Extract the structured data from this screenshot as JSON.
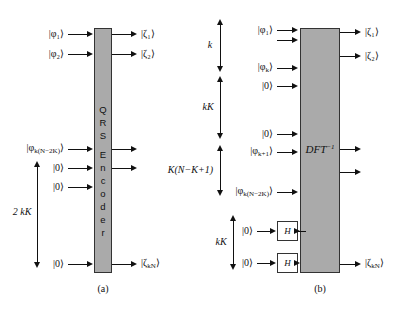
{
  "figure": {
    "panels": [
      {
        "id": "a",
        "caption": "(a)",
        "block": {
          "label": "QRS Encoder",
          "letters": [
            "Q",
            "R",
            "S",
            "E",
            "n",
            "c",
            "o",
            "d",
            "e",
            "r"
          ]
        },
        "inputs": [
          {
            "name": "input-phi-1",
            "label": "|φ₁⟩"
          },
          {
            "name": "input-phi-2",
            "label": "|φ₂⟩"
          },
          {
            "name": "input-phi-kn2k",
            "label": "|φ",
            "sub": "k(N−2K)",
            "tail": "⟩"
          },
          {
            "name": "input-zero-1",
            "label": "|0⟩"
          },
          {
            "name": "input-zero-2",
            "label": "|0⟩"
          },
          {
            "name": "input-zero-3",
            "label": "|0⟩"
          }
        ],
        "outputs": [
          {
            "name": "output-zeta-1",
            "label": "|ζ₁⟩"
          },
          {
            "name": "output-zeta-2",
            "label": "|ζ₂⟩"
          },
          {
            "name": "output-unlabeled-1",
            "label": ""
          },
          {
            "name": "output-unlabeled-2",
            "label": ""
          },
          {
            "name": "output-zeta-kn",
            "label": "|ζ",
            "sub": "kN",
            "tail": "⟩"
          }
        ],
        "braces": [
          {
            "name": "brace-2kK",
            "label": "2 kK"
          }
        ]
      },
      {
        "id": "b",
        "caption": "(b)",
        "block": {
          "label": "DFT",
          "sup": "−1"
        },
        "gates": [
          {
            "name": "hadamard-gate-1",
            "label": "H"
          },
          {
            "name": "hadamard-gate-2",
            "label": "H"
          }
        ],
        "inputs": [
          {
            "name": "input-phi-1",
            "label": "|φ₁⟩"
          },
          {
            "name": "input-phi-1-second",
            "label": ""
          },
          {
            "name": "input-phi-k",
            "label": "|φ",
            "sub": "k",
            "tail": "⟩"
          },
          {
            "name": "input-zero-1",
            "label": "|0⟩"
          },
          {
            "name": "input-zero-2",
            "label": "|0⟩"
          },
          {
            "name": "input-phi-k1",
            "label": "|φ",
            "sub": "k+1",
            "tail": "⟩"
          },
          {
            "name": "input-phi-kn2k",
            "label": "|φ",
            "sub": "k(N−2K)",
            "tail": "⟩"
          },
          {
            "name": "input-zero-h1",
            "label": "|0⟩"
          },
          {
            "name": "input-zero-h2",
            "label": "|0⟩"
          }
        ],
        "outputs": [
          {
            "name": "output-zeta-1",
            "label": "|ζ₁⟩"
          },
          {
            "name": "output-zeta-2",
            "label": "|ζ₂⟩"
          },
          {
            "name": "output-unlabeled-1",
            "label": ""
          },
          {
            "name": "output-unlabeled-2",
            "label": ""
          },
          {
            "name": "output-zeta-kn",
            "label": "|ζ",
            "sub": "kN",
            "tail": "⟩"
          }
        ],
        "braces": [
          {
            "name": "brace-k",
            "label": "k"
          },
          {
            "name": "brace-kK-upper",
            "label": "kK"
          },
          {
            "name": "brace-knk1",
            "label": "K(N−K+1)"
          },
          {
            "name": "brace-kK-lower",
            "label": "kK"
          }
        ]
      }
    ]
  },
  "colors": {
    "block_fill": "#aaaaaa",
    "stroke": "#111111",
    "gate_fill": "#ffffff"
  }
}
